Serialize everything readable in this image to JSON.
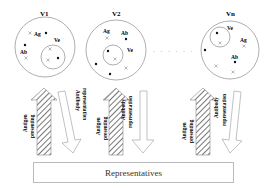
{
  "diagram": {
    "populations": [
      {
        "label": "V1",
        "cx": 45,
        "cy": 47,
        "r": 30,
        "inner": {
          "label": "Ve",
          "cx": 53,
          "cy": 57,
          "r": 12,
          "label_x": 50,
          "label_y": 41
        },
        "ag_label": {
          "text": "Ag",
          "x": 35,
          "y": 35
        },
        "ab_label": {
          "text": "Ab",
          "x": 21,
          "y": 53
        },
        "dots": [
          [
            46,
            32
          ],
          [
            25,
            45
          ],
          [
            58,
            58
          ]
        ],
        "crosses": [
          [
            30,
            33
          ],
          [
            26,
            58
          ],
          [
            50,
            49
          ],
          [
            48,
            60
          ]
        ]
      },
      {
        "label": "V2",
        "cx": 116,
        "cy": 50,
        "r": 30,
        "inner": {
          "label": "Ve",
          "cx": 113,
          "cy": 57,
          "r": 10,
          "label_x": 128,
          "label_y": 52
        },
        "ag_label": {
          "text": "Ag",
          "x": 103,
          "y": 34
        },
        "ab_label": {
          "text": "Ab",
          "x": 121,
          "y": 35
        },
        "dots": [
          [
            126,
            38
          ],
          [
            108,
            51
          ],
          [
            96,
            64
          ],
          [
            110,
            74
          ]
        ],
        "crosses": [
          [
            107,
            38
          ],
          [
            115,
            59
          ],
          [
            126,
            68
          ]
        ]
      },
      {
        "label": "Vn",
        "cx": 230,
        "cy": 50,
        "r": 29,
        "inner": {
          "label": "Ve",
          "cx": 219,
          "cy": 37,
          "r": 10,
          "label_x": 229,
          "label_y": 29
        },
        "ag_label": {
          "text": "Ag",
          "x": 241,
          "y": 42
        },
        "ab_label": {
          "text": "Ab",
          "x": 231,
          "y": 58
        },
        "dots": [
          [
            217,
            33
          ],
          [
            205,
            50
          ],
          [
            235,
            62
          ]
        ],
        "crosses": [
          [
            220,
            43
          ],
          [
            244,
            46
          ],
          [
            216,
            66
          ],
          [
            233,
            72
          ]
        ]
      }
    ],
    "ellipsis": "· · · · · ·",
    "arrows": [
      {
        "up_label_line1": "Antigen",
        "up_label_line2": "presenting",
        "down_label_line1": "Antibody",
        "down_label_line2": "representation"
      },
      {
        "up_label_line1": "Antigen",
        "up_label_line2": "presenting",
        "down_label_line1": "Antibody",
        "down_label_line2": "representation"
      },
      {
        "up_label_line1": "Antigen",
        "up_label_line2": "presenting",
        "down_label_line1": "Antibody",
        "down_label_line2": "representation"
      }
    ],
    "bottom_box": "Representatives"
  }
}
